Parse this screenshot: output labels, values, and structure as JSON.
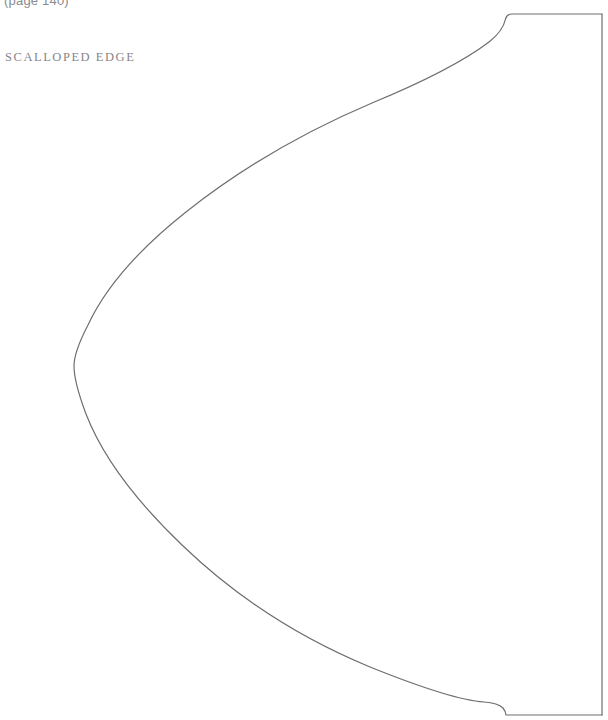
{
  "document": {
    "type": "sewing-pattern-template",
    "page_reference": "(page 140)",
    "piece_label": "SCALLOPED EDGE",
    "background_color": "#ffffff",
    "line_color": "#6e6e72",
    "label_color": "#86868a",
    "page_ref_color": "#8a8a8e"
  },
  "pattern": {
    "name": "scalloped-edge-piece",
    "stroke_width": 1.2,
    "outline_path": "M 602 14 L 512 14 Q 507 14 505.5 19 Q 503 31 489 42 Q 452 70 372 103 Q 268 147 186 212 Q 114 269 88 325 Q 74 352 74 366 Q 74 382 86 414 Q 110 476 182 545 Q 263 623 370 667 Q 452 700 484 702 Q 498 703 503 708 Q 505.5 711 506 715 L 602 715",
    "right_edge": {
      "x": 602,
      "y_top": 14,
      "y_bottom": 715
    },
    "leftmost_point": {
      "x": 74,
      "y": 366
    },
    "top_corner": {
      "x": 507,
      "y": 14
    },
    "bottom_corner": {
      "x": 506,
      "y": 715
    }
  }
}
